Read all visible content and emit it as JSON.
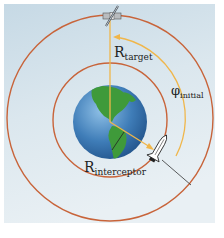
{
  "diagram": {
    "type": "orbital-intercept",
    "labels": {
      "r_target_main": "R",
      "r_target_sub": "target",
      "phi_main": "φ",
      "phi_sub": "initial",
      "r_interceptor_main": "R",
      "r_interceptor_sub": "interceptor"
    },
    "objects": {
      "center_body": "Earth",
      "target": "satellite",
      "interceptor": "space shuttle"
    },
    "colors": {
      "panel_top": "#c9dbe6",
      "panel_bottom": "#eef3f6",
      "orbit": "#c8643a",
      "angle_arc": "#f0b64a",
      "radius_line": "#f0b64a",
      "ocean": "#3c78b0",
      "land": "#3f9a3a"
    }
  }
}
